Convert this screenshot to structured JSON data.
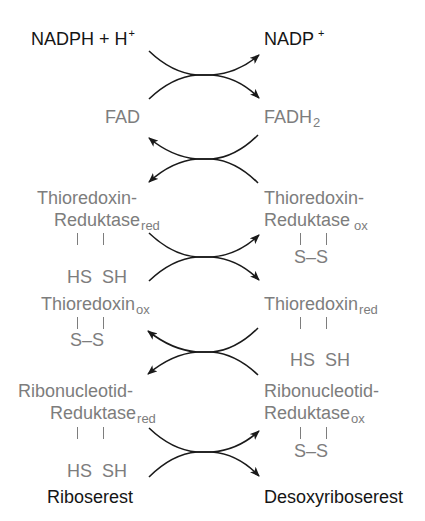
{
  "diagram": {
    "type": "redox-cascade",
    "colors": {
      "primary_text": "#151515",
      "secondary_text": "#7d7d7d",
      "arrow": "#1a1a1a"
    },
    "top": {
      "left": {
        "main": "NADPH + H",
        "sup": "+"
      },
      "right": {
        "main": "NADP",
        "sup": "+"
      }
    },
    "fad": {
      "left": {
        "main": "FAD"
      },
      "right": {
        "main": "FADH",
        "sub": "2"
      }
    },
    "trx_reductase": {
      "left": {
        "line1": "Thioredoxin-",
        "line2": "Reduktase",
        "sub": "red",
        "groups": "HS  SH"
      },
      "right": {
        "line1": "Thioredoxin-",
        "line2": "Reduktase",
        "sub": "ox",
        "groups": "S–S"
      }
    },
    "thioredoxin": {
      "left": {
        "main": "Thioredoxin",
        "sub": "ox",
        "groups": "S–S"
      },
      "right": {
        "main": "Thioredoxin",
        "sub": "red",
        "groups": "HS  SH"
      }
    },
    "rnr": {
      "left": {
        "line1": "Ribonucleotid-",
        "line2": "Reduktase",
        "sub": "red",
        "groups": "HS  SH"
      },
      "right": {
        "line1": "Ribonucleotid-",
        "line2": "Reduktase",
        "sub": "ox",
        "groups": "S–S"
      }
    },
    "bottom": {
      "left": {
        "main": "Riboserest"
      },
      "right": {
        "main": "Desoxyriboserest"
      }
    },
    "reactions": [
      {
        "from": [
          "NADPH + H+",
          "FAD"
        ],
        "to": [
          "NADP+",
          "FADH2"
        ],
        "direction": "right"
      },
      {
        "from": [
          "FADH2",
          "Thioredoxin-Reduktase ox"
        ],
        "to": [
          "FAD",
          "Thioredoxin-Reduktase red"
        ],
        "direction": "left"
      },
      {
        "from": [
          "Thioredoxin-Reduktase red",
          "Thioredoxin ox"
        ],
        "to": [
          "Thioredoxin-Reduktase ox",
          "Thioredoxin red"
        ],
        "direction": "right"
      },
      {
        "from": [
          "Thioredoxin red",
          "Ribonucleotid-Reduktase ox"
        ],
        "to": [
          "Thioredoxin ox",
          "Ribonucleotid-Reduktase red"
        ],
        "direction": "left"
      },
      {
        "from": [
          "Ribonucleotid-Reduktase red",
          "Riboserest"
        ],
        "to": [
          "Ribonucleotid-Reduktase ox",
          "Desoxyriboserest"
        ],
        "direction": "right"
      }
    ]
  }
}
